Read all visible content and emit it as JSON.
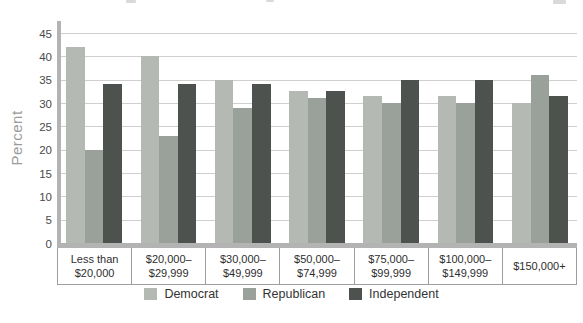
{
  "figure": {
    "y_axis_title": "Percent"
  },
  "chart_data": {
    "type": "bar",
    "title": "",
    "xlabel": "",
    "ylabel": "Percent",
    "ylim": [
      0,
      45
    ],
    "yticks": [
      0,
      5,
      10,
      15,
      20,
      25,
      30,
      35,
      40,
      45
    ],
    "grid": true,
    "legend_position": "bottom",
    "categories": [
      "Less than\n$20,000",
      "$20,000–\n$29,999",
      "$30,000–\n$49,999",
      "$50,000–\n$74,999",
      "$75,000–\n$99,999",
      "$100,000–\n$149,999",
      "$150,000+"
    ],
    "series": [
      {
        "name": "Democrat",
        "color": "#b4b9b3",
        "values": [
          42,
          40,
          35,
          32.5,
          31.5,
          31.5,
          30
        ]
      },
      {
        "name": "Republican",
        "color": "#9aa09a",
        "values": [
          20,
          23,
          29,
          31,
          30,
          30,
          36
        ]
      },
      {
        "name": "Independent",
        "color": "#4e524e",
        "values": [
          34,
          34,
          34,
          32.5,
          35,
          35,
          31.5
        ]
      }
    ]
  }
}
